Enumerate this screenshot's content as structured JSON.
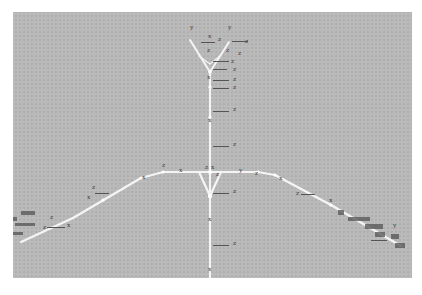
{
  "scene": {
    "description": "3D viewport showing a joint skeleton hierarchy with local axis labels",
    "background_color": "#b9b9b9",
    "bone_color": "#f2f2f2",
    "label_color": "#3a3a3a"
  },
  "labels": {
    "top_left_y": "y",
    "top_right_y": "y",
    "top_z1": "z",
    "top_z2": "z",
    "top_z3": "z",
    "top_z4": "z",
    "top_z5": "z",
    "top_z6": "z",
    "top_z7": "z",
    "top_x1": "x",
    "spine_z1": "z",
    "spine_z2": "z",
    "spine_z3": "z",
    "spine_z4": "z",
    "spine_z5": "z",
    "spine_x1": "x",
    "spine_x2": "x",
    "spine_x3": "x",
    "hip_z_left": "z",
    "hip_x": "x",
    "hip_z_center": "z",
    "hip_y_right": "y",
    "hip_z_right": "z",
    "arm_left_x1": "x",
    "arm_left_z1": "z",
    "arm_left_z2": "z",
    "arm_left_x2": "x",
    "arm_left_z3": "z",
    "arm_left_x3": "x",
    "arm_right_x1": "x",
    "arm_right_z1": "z",
    "arm_right_x2": "x",
    "arm_right_y1": "y",
    "leg_z1": "z",
    "leg_x1": "x",
    "leg_z2": "z",
    "leg_x2": "x"
  }
}
